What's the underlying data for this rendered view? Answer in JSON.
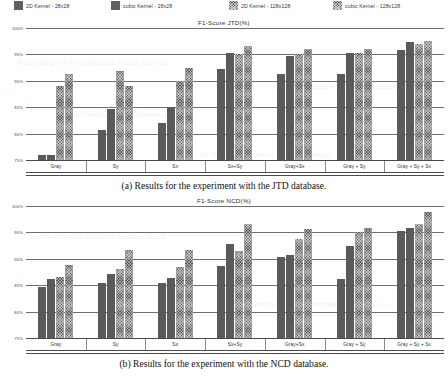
{
  "legend": {
    "items": [
      {
        "label": "2D Kernel - 28x28",
        "style": "plain",
        "color": "#5a5a5a"
      },
      {
        "label": "cubic Kernel - 28x28",
        "style": "plain",
        "color": "#5a5a5a"
      },
      {
        "label": "2D Kernel - 128x128",
        "style": "hatch",
        "color": "#5a5a5a"
      },
      {
        "label": "cubic Kernel - 128x128",
        "style": "hatch",
        "color": "#5a5a5a"
      }
    ]
  },
  "figures": [
    {
      "id": "jtd",
      "caption": "(a) Results for the experiment with the JTD database."
    },
    {
      "id": "ncd",
      "caption": "(b) Results for the experiment with the NCD database."
    }
  ],
  "chart_data": [
    {
      "type": "bar",
      "id": "jtd",
      "title": "F1-Score JTD(%)",
      "xlabel": "",
      "ylabel": "",
      "ylim": [
        75,
        100
      ],
      "yticks": [
        75,
        80,
        85,
        90,
        95,
        100
      ],
      "ytick_labels": [
        "75%",
        "80%",
        "85%",
        "90%",
        "95%",
        "100%"
      ],
      "grid": true,
      "legend_position": "top",
      "categories": [
        "Gray",
        "Sy",
        "Sx",
        "Sx+Sy",
        "Gray+Sx",
        "Gray + Sy",
        "Gray + Sy + Sx"
      ],
      "series": [
        {
          "name": "2D Kernel - 28x28",
          "values": [
            76.0,
            80.6,
            82.0,
            92.3,
            91.2,
            91.2,
            95.8
          ]
        },
        {
          "name": "cubic Kernel - 28x28",
          "values": [
            76.0,
            84.6,
            85.0,
            95.2,
            94.7,
            95.2,
            97.3
          ]
        },
        {
          "name": "2D Kernel - 128x128",
          "values": [
            89.0,
            91.8,
            90.0,
            95.0,
            95.0,
            95.2,
            97.0
          ]
        },
        {
          "name": "cubic Kernel - 128x128",
          "values": [
            91.3,
            89.0,
            92.4,
            96.5,
            96.0,
            96.0,
            97.5
          ]
        }
      ]
    },
    {
      "type": "bar",
      "id": "ncd",
      "title": "F1-Score NCD(%)",
      "xlabel": "",
      "ylabel": "",
      "ylim": [
        75,
        100
      ],
      "yticks": [
        75,
        80,
        85,
        90,
        95,
        100
      ],
      "ytick_labels": [
        "75%",
        "80%",
        "85%",
        "90%",
        "95%",
        "100%"
      ],
      "grid": true,
      "legend_position": "top",
      "categories": [
        "Gray",
        "Sy",
        "Sx",
        "Sx+Sy",
        "Gray+Sx",
        "Gray + Sy",
        "Gray + Sy + Sx"
      ],
      "series": [
        {
          "name": "2D Kernel - 28x28",
          "values": [
            84.6,
            85.4,
            85.4,
            88.7,
            90.3,
            86.1,
            95.3
          ]
        },
        {
          "name": "cubic Kernel - 28x28",
          "values": [
            86.1,
            87.2,
            86.4,
            92.8,
            90.7,
            92.4,
            95.8
          ]
        },
        {
          "name": "2D Kernel - 128x128",
          "values": [
            86.5,
            88.0,
            88.4,
            91.4,
            93.8,
            95.0,
            96.5
          ]
        },
        {
          "name": "cubic Kernel - 128x128",
          "values": [
            88.8,
            91.7,
            91.7,
            96.5,
            95.7,
            95.8,
            98.8
          ]
        }
      ]
    }
  ],
  "ghost_text": [
    "Proceedings of the experiment results data sets",
    "for the classification of biometric images",
    "kernel sizes with accuracy measures listed"
  ]
}
